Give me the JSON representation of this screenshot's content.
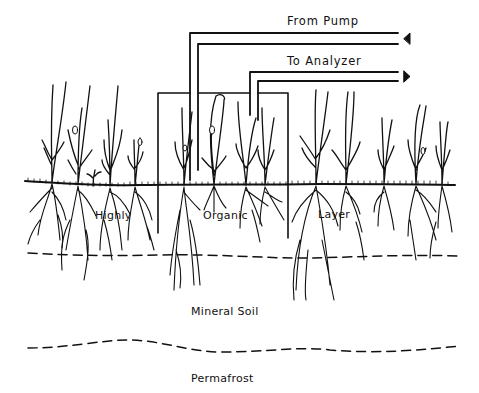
{
  "diagram": {
    "type": "soil-gas-sampling-chamber-schematic",
    "tubes": {
      "from_pump": {
        "label": "From Pump",
        "direction": "in",
        "arrow": "left-pointing-arrowhead"
      },
      "to_analyzer": {
        "label": "To Analyzer",
        "direction": "out",
        "arrow": "right-pointing-arrowhead"
      }
    },
    "chamber": {
      "label": "",
      "shape": "open-bottom-box over vegetation"
    },
    "layers": {
      "organic_words": [
        "Highly",
        "Organic",
        "Layer"
      ],
      "mineral": "Mineral Soil",
      "permafrost": "Permafrost"
    },
    "colors": {
      "line": "#111111",
      "background": "#ffffff"
    }
  }
}
